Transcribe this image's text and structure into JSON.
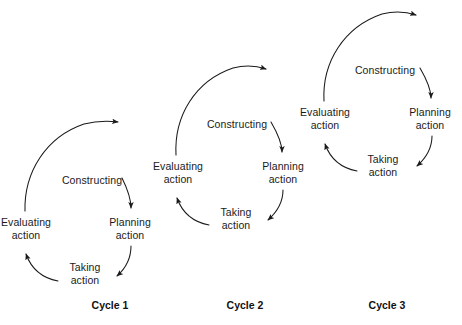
{
  "diagram": {
    "background": "#ffffff",
    "stroke_color": "#1a1a1a",
    "text_color": "#1a1a1a",
    "cycles": [
      {
        "caption": "Cycle 1",
        "caption_x": 110,
        "caption_y": 305,
        "center_x": 78,
        "center_y": 227,
        "radius": 52,
        "nodes": [
          {
            "name": "constructing",
            "line1": "Constructing",
            "line2": "",
            "x": 92,
            "y": 180
          },
          {
            "name": "planning-action",
            "line1": "Planning",
            "line2": "action",
            "x": 130,
            "y": 228
          },
          {
            "name": "taking-action",
            "line1": "Taking",
            "line2": "action",
            "x": 85,
            "y": 273
          },
          {
            "name": "evaluating-action",
            "line1": "Evaluating",
            "line2": "action",
            "x": 26,
            "y": 228
          }
        ],
        "outgoing_arrow_tip_x": 122,
        "outgoing_arrow_tip_y": 122
      },
      {
        "caption": "Cycle 2",
        "caption_x": 245,
        "caption_y": 305,
        "center_x": 230,
        "center_y": 171,
        "radius": 52,
        "nodes": [
          {
            "name": "constructing",
            "line1": "Constructing",
            "line2": "",
            "x": 237,
            "y": 124
          },
          {
            "name": "planning-action",
            "line1": "Planning",
            "line2": "action",
            "x": 283,
            "y": 172
          },
          {
            "name": "taking-action",
            "line1": "Taking",
            "line2": "action",
            "x": 236,
            "y": 218
          },
          {
            "name": "evaluating-action",
            "line1": "Evaluating",
            "line2": "action",
            "x": 178,
            "y": 172
          }
        ],
        "outgoing_arrow_tip_x": 270,
        "outgoing_arrow_tip_y": 70
      },
      {
        "caption": "Cycle 3",
        "caption_x": 387,
        "caption_y": 305,
        "center_x": 378,
        "center_y": 117,
        "radius": 52,
        "nodes": [
          {
            "name": "constructing",
            "line1": "Constructing",
            "line2": "",
            "x": 385,
            "y": 70
          },
          {
            "name": "planning-action",
            "line1": "Planning",
            "line2": "action",
            "x": 430,
            "y": 118
          },
          {
            "name": "taking-action",
            "line1": "Taking",
            "line2": "action",
            "x": 383,
            "y": 165
          },
          {
            "name": "evaluating-action",
            "line1": "Evaluating",
            "line2": "action",
            "x": 325,
            "y": 118
          }
        ],
        "outgoing_arrow_tip_x": 420,
        "outgoing_arrow_tip_y": 16
      }
    ]
  }
}
